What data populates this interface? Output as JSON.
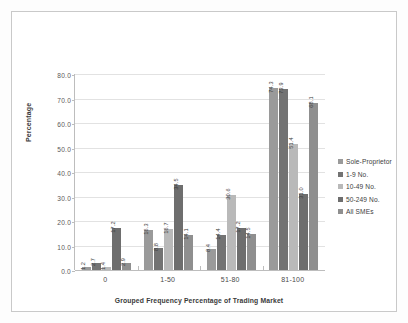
{
  "chart_data": {
    "type": "bar",
    "title": "",
    "xlabel": "Grouped Frequency Percentage of Trading Market",
    "ylabel": "Percentage",
    "categories": [
      "0",
      "1-50",
      "51-80",
      "81-100"
    ],
    "ylim": [
      0,
      80
    ],
    "yticks": [
      "0.0",
      "10.0",
      "20.0",
      "30.0",
      "40.0",
      "50.0",
      "60.0",
      "70.0",
      "80.0"
    ],
    "grid": true,
    "legend_position": "right",
    "series": [
      {
        "name": "Sole-Proprietor",
        "color": "#9a9a9a",
        "values": [
          1.2,
          16.3,
          8.4,
          74.3
        ],
        "labels": [
          "1.2",
          "16.3",
          "8.4",
          "74.3"
        ]
      },
      {
        "name": "1-9 No.",
        "color": "#737373",
        "values": [
          2.7,
          8.8,
          14.4,
          73.9
        ],
        "labels": [
          "2.7",
          "8.8",
          "14.4",
          "73.9"
        ]
      },
      {
        "name": "10-49 No.",
        "color": "#b9b9b9",
        "values": [
          1.4,
          16.7,
          30.6,
          51.4
        ],
        "labels": [
          "1.4",
          "16.7",
          "30.6",
          "51.4"
        ]
      },
      {
        "name": "50-249 No.",
        "color": "#6e6e6e",
        "values": [
          17.2,
          34.5,
          17.2,
          31.0
        ],
        "labels": [
          "17.2",
          "34.5",
          "17.2",
          "31.0"
        ]
      },
      {
        "name": "All SMEs",
        "color": "#8f8f8f",
        "values": [
          2.9,
          14.1,
          14.5,
          68.1
        ],
        "labels": [
          "2.9",
          "14.1",
          "14.5",
          "68.1"
        ]
      }
    ]
  }
}
